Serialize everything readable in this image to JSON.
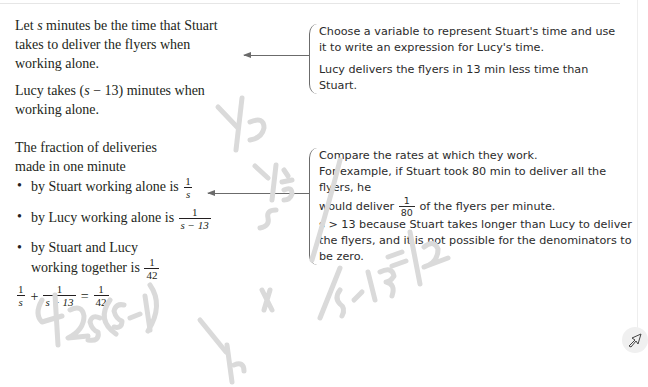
{
  "left": {
    "para1": [
      "Let ",
      "s",
      " minutes be the time that Stuart takes to deliver the flyers when working alone."
    ],
    "para2": {
      "pre": "Lucy takes (",
      "var": "s",
      "mid": " − 13)",
      "post": " minutes when working alone."
    },
    "para3": "The fraction of deliveries made in one minute",
    "bullets": [
      {
        "text": "by Stuart working alone is",
        "num": "1",
        "den": "s"
      },
      {
        "text": "by Lucy working alone is",
        "num": "1",
        "den": "s − 13"
      },
      {
        "text": "by Stuart and Lucy working together is",
        "num": "1",
        "den": "42"
      }
    ],
    "equation": {
      "t1": {
        "num": "1",
        "den": "s"
      },
      "op1": "+",
      "t2": {
        "num": "1",
        "den": "s − 13"
      },
      "op2": "=",
      "t3": {
        "num": "1",
        "den": "42"
      }
    }
  },
  "notes": [
    {
      "lines": [
        "Choose a variable to represent Stuart's time and use it to write an expression for Lucy's time.",
        "Lucy delivers the flyers in 13 min less time than Stuart."
      ]
    },
    {
      "line1": "Compare the rates at which they work.",
      "line2": "For example, if Stuart took 80 min to deliver all the flyers, he",
      "line3_pre": "would deliver",
      "line3_frac": {
        "num": "1",
        "den": "80"
      },
      "line3_post": "of the flyers per minute.",
      "line4": "s > 13 because Stuart takes longer than Lucy to deliver the flyers, and it is not possible for the denominators to be zero."
    }
  ],
  "annotations": {
    "handwriting": [
      "1/s",
      "s-13",
      "42s(s-13)",
      "1/s x",
      "1/s-13 = 1/42"
    ],
    "color": "#d9d9d9"
  },
  "tools": {
    "cursor_icon": "pointer-arrow-icon"
  }
}
